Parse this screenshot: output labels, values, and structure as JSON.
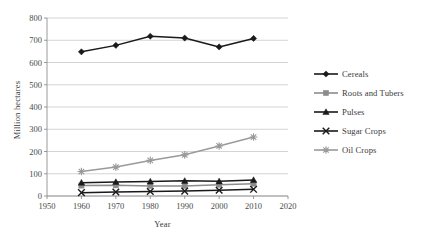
{
  "chart_data": {
    "type": "line",
    "title": "",
    "xlabel": "Year",
    "ylabel": "Million hectares",
    "xlim": [
      1950,
      2020
    ],
    "ylim": [
      0,
      800
    ],
    "xticks": [
      1950,
      1960,
      1970,
      1980,
      1990,
      2000,
      2010,
      2020
    ],
    "yticks": [
      0,
      100,
      200,
      300,
      400,
      500,
      600,
      700,
      800
    ],
    "grid": "horizontal",
    "legend_position": "right",
    "x": [
      1960,
      1970,
      1980,
      1990,
      2000,
      2010
    ],
    "series": [
      {
        "name": "Cereals",
        "marker": "diamond",
        "color": "#1a1a1a",
        "values": [
          648,
          677,
          718,
          710,
          670,
          708
        ]
      },
      {
        "name": "Roots and Tubers",
        "marker": "square",
        "color": "#8c8c8c",
        "values": [
          47,
          48,
          45,
          45,
          51,
          55
        ]
      },
      {
        "name": "Pulses",
        "marker": "triangle",
        "color": "#1a1a1a",
        "values": [
          60,
          63,
          65,
          68,
          66,
          72
        ]
      },
      {
        "name": "Sugar Crops",
        "marker": "x",
        "color": "#1a1a1a",
        "values": [
          15,
          18,
          20,
          22,
          26,
          30
        ]
      },
      {
        "name": "Oil Crops",
        "marker": "asterisk",
        "color": "#9a9a9a",
        "values": [
          110,
          130,
          160,
          185,
          225,
          265
        ]
      }
    ]
  },
  "colors": {
    "gridline": "#c9c9c9",
    "axis": "#8f8f8f",
    "text": "#3a3a3a",
    "dark_series": "#1a1a1a",
    "gray_series": "#8c8c8c",
    "light_gray_series": "#9a9a9a",
    "background": "#ffffff"
  }
}
